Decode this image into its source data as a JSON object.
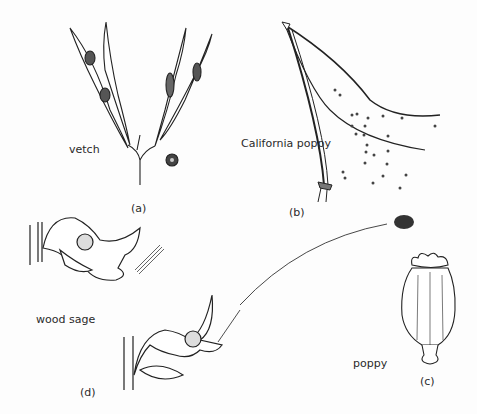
{
  "figure": {
    "panels": [
      {
        "id": "a",
        "caption": "(a)",
        "plant": "vetch"
      },
      {
        "id": "b",
        "caption": "(b)",
        "plant": "California poppy"
      },
      {
        "id": "c",
        "caption": "(c)",
        "plant": "poppy"
      },
      {
        "id": "d",
        "caption": "(d)",
        "plant": "wood sage"
      }
    ]
  }
}
